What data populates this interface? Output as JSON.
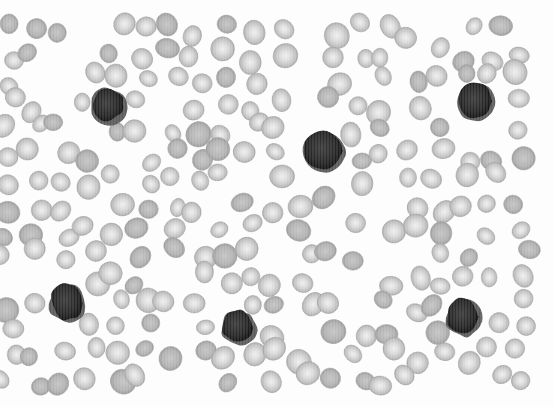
{
  "image": {
    "subject": "Peripheral blood smear micrograph (grayscale)",
    "description": "Field of red blood cells with scattered dark-staining nucleated white cells",
    "colors": {
      "background": "#fdfdfd",
      "rbc_fill": "#c9c9c9",
      "rbc_center": "#ececec",
      "rbc_edge": "#a9a9a9",
      "wbc_fill": "#2a2a2a",
      "wbc_edge": "#151515"
    },
    "white_cells": [
      {
        "label": "dark-nucleated-cell-1"
      },
      {
        "label": "dark-nucleated-cell-2"
      },
      {
        "label": "dark-nucleated-cell-3"
      },
      {
        "label": "dark-nucleated-cell-4"
      },
      {
        "label": "dark-nucleated-cell-5"
      },
      {
        "label": "dark-nucleated-cell-6"
      }
    ],
    "red_cell_count_estimate": 260
  }
}
